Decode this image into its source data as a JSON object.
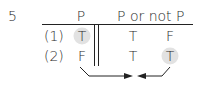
{
  "problem": {
    "number": "5"
  },
  "table": {
    "headers": {
      "p": "P",
      "expr": "P or not P"
    },
    "rows": [
      {
        "label": "(1)",
        "p": "T",
        "p_or": "T",
        "not_p": "F"
      },
      {
        "label": "(2)",
        "p": "F",
        "p_or": "T",
        "not_p": "T"
      }
    ],
    "highlighted_cells": [
      "row1.p",
      "row2.not_p"
    ]
  },
  "colors": {
    "text": "#2a2a2a",
    "highlight": "#e2e2e2",
    "line": "#222222"
  }
}
